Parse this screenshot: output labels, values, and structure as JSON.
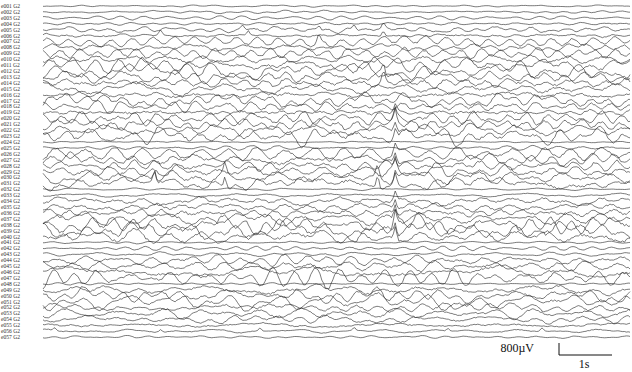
{
  "chart_data": {
    "type": "line",
    "title": "",
    "channel_suffix": "G2",
    "channels": [
      {
        "name": "e001 G2",
        "amp": 0.25,
        "spikes": []
      },
      {
        "name": "e002 G2",
        "amp": 0.35,
        "spikes": []
      },
      {
        "name": "e003 G2",
        "amp": 0.4,
        "spikes": []
      },
      {
        "name": "e004 G2",
        "amp": 0.5,
        "spikes": []
      },
      {
        "name": "e005 G2",
        "amp": 0.9,
        "spikes": [
          0.34,
          0.47,
          0.53,
          0.58
        ]
      },
      {
        "name": "e006 G2",
        "amp": 1.0,
        "spikes": [
          0.2,
          0.35,
          0.58
        ]
      },
      {
        "name": "e007 G2",
        "amp": 1.3,
        "spikes": [
          0.47
        ]
      },
      {
        "name": "e008 G2",
        "amp": 1.1,
        "spikes": []
      },
      {
        "name": "e009 G2",
        "amp": 1.6,
        "spikes": []
      },
      {
        "name": "e010 G2",
        "amp": 1.7,
        "spikes": []
      },
      {
        "name": "e011 G2",
        "amp": 1.9,
        "spikes": []
      },
      {
        "name": "e012 G2",
        "amp": 2.0,
        "spikes": []
      },
      {
        "name": "e013 G2",
        "amp": 1.8,
        "spikes": [
          0.58
        ]
      },
      {
        "name": "e014 G2",
        "amp": 2.1,
        "spikes": [
          0.58
        ]
      },
      {
        "name": "e015 G2",
        "amp": 1.7,
        "spikes": []
      },
      {
        "name": "e016 G2",
        "amp": 1.6,
        "spikes": []
      },
      {
        "name": "e017 G2",
        "amp": 1.8,
        "spikes": []
      },
      {
        "name": "e018 G2",
        "amp": 1.5,
        "spikes": []
      },
      {
        "name": "e019 G2",
        "amp": 1.7,
        "spikes": [
          0.6
        ]
      },
      {
        "name": "e020 G2",
        "amp": 1.9,
        "spikes": [
          0.6
        ]
      },
      {
        "name": "e021 G2",
        "amp": 2.2,
        "spikes": [
          0.6
        ]
      },
      {
        "name": "e022 G2",
        "amp": 2.0,
        "spikes": [
          0.6
        ]
      },
      {
        "name": "e023 G2",
        "amp": 2.3,
        "spikes": [
          0.6
        ]
      },
      {
        "name": "e024 G2",
        "amp": 0.3,
        "spikes": []
      },
      {
        "name": "e025 G2",
        "amp": 0.6,
        "spikes": []
      },
      {
        "name": "e026 G2",
        "amp": 1.8,
        "spikes": [
          0.6
        ]
      },
      {
        "name": "e027 G2",
        "amp": 1.9,
        "spikes": [
          0.6
        ]
      },
      {
        "name": "e028 G2",
        "amp": 1.8,
        "spikes": [
          0.6
        ]
      },
      {
        "name": "e029 G2",
        "amp": 2.0,
        "spikes": [
          0.6
        ]
      },
      {
        "name": "e030 G2",
        "amp": 2.1,
        "spikes": [
          0.19,
          0.31,
          0.57,
          0.6
        ]
      },
      {
        "name": "e031 G2",
        "amp": 2.2,
        "spikes": [
          0.19,
          0.31,
          0.57,
          0.6
        ]
      },
      {
        "name": "e032 G2",
        "amp": 0.3,
        "spikes": []
      },
      {
        "name": "e033 G2",
        "amp": 0.6,
        "spikes": []
      },
      {
        "name": "e034 G2",
        "amp": 1.7,
        "spikes": [
          0.6
        ]
      },
      {
        "name": "e035 G2",
        "amp": 1.8,
        "spikes": [
          0.6
        ]
      },
      {
        "name": "e036 G2",
        "amp": 2.0,
        "spikes": [
          0.6
        ]
      },
      {
        "name": "e037 G2",
        "amp": 2.2,
        "spikes": [
          0.6
        ]
      },
      {
        "name": "e038 G2",
        "amp": 2.4,
        "spikes": [
          0.6
        ]
      },
      {
        "name": "e039 G2",
        "amp": 2.5,
        "spikes": [
          0.6
        ]
      },
      {
        "name": "e040 G2",
        "amp": 2.3,
        "spikes": [
          0.6
        ]
      },
      {
        "name": "e041 G2",
        "amp": 0.3,
        "spikes": []
      },
      {
        "name": "e042 G2",
        "amp": 0.5,
        "spikes": []
      },
      {
        "name": "e043 G2",
        "amp": 0.6,
        "spikes": []
      },
      {
        "name": "e044 G2",
        "amp": 1.4,
        "spikes": []
      },
      {
        "name": "e045 G2",
        "amp": 1.8,
        "spikes": []
      },
      {
        "name": "e046 G2",
        "amp": 2.0,
        "spikes": []
      },
      {
        "name": "e047 G2",
        "amp": 1.9,
        "spikes": []
      },
      {
        "name": "e048 G2",
        "amp": 0.3,
        "spikes": []
      },
      {
        "name": "e049 G2",
        "amp": 1.5,
        "spikes": []
      },
      {
        "name": "e050 G2",
        "amp": 1.6,
        "spikes": []
      },
      {
        "name": "e051 G2",
        "amp": 1.7,
        "spikes": []
      },
      {
        "name": "e052 G2",
        "amp": 1.5,
        "spikes": []
      },
      {
        "name": "e053 G2",
        "amp": 1.6,
        "spikes": []
      },
      {
        "name": "e054 G2",
        "amp": 1.2,
        "spikes": []
      },
      {
        "name": "e055 G2",
        "amp": 1.0,
        "spikes": []
      },
      {
        "name": "e056 G2",
        "amp": 0.6,
        "spikes": [
          0.02,
          0.2,
          0.37,
          0.53,
          0.69,
          0.85
        ]
      },
      {
        "name": "e057 G2",
        "amp": 0.3,
        "spikes": []
      }
    ],
    "scale_bar": {
      "amplitude_label": "800µV",
      "time_label": "1s"
    }
  }
}
